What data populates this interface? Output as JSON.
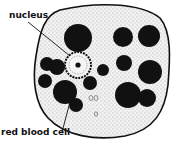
{
  "diagram": {
    "labels": {
      "nucleus": "nucleus",
      "rbc": "red blood cell"
    },
    "colors": {
      "ink": "#111111",
      "cytoplasm": "#e6e6e6"
    }
  }
}
